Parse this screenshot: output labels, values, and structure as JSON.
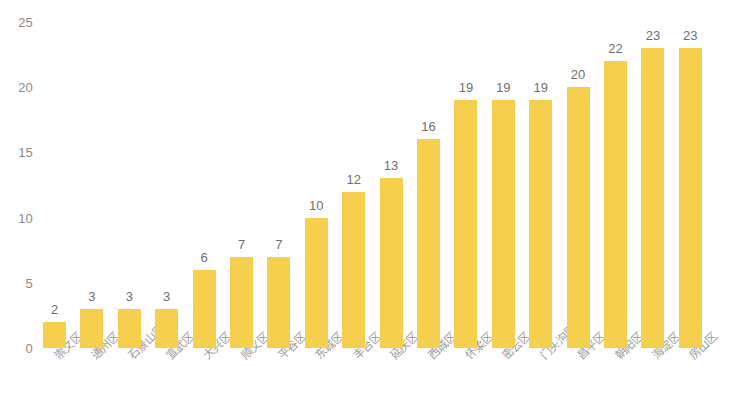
{
  "chart_data": {
    "type": "bar",
    "title": "",
    "subtitle": "",
    "xlabel": "",
    "ylabel": "",
    "ylim": [
      0,
      25
    ],
    "yticks": [
      0,
      5,
      10,
      15,
      20,
      25
    ],
    "grid": false,
    "legend": null,
    "bar_color": "#f7cf4f",
    "label_color": "#9b9b9b",
    "value_color": "#6f6f6f",
    "categories": [
      "崇文区",
      "通州区",
      "石景山区",
      "宣武区",
      "大兴区",
      "顺义区",
      "平谷区",
      "东城区",
      "丰台区",
      "延庆区",
      "西城区",
      "怀柔区",
      "密云区",
      "门头沟区",
      "昌平区",
      "朝阳区",
      "海淀区",
      "房山区"
    ],
    "values": [
      2,
      3,
      3,
      3,
      6,
      7,
      7,
      10,
      12,
      13,
      16,
      19,
      19,
      19,
      20,
      22,
      23,
      23
    ],
    "value_labels": [
      "2",
      "3",
      "3",
      "3",
      "6",
      "7",
      "7",
      "10",
      "12",
      "13",
      "16",
      "19",
      "19",
      "19",
      "20",
      "22",
      "23",
      "23"
    ],
    "ytick_labels": [
      "0",
      "5",
      "10",
      "15",
      "20",
      "25"
    ]
  }
}
